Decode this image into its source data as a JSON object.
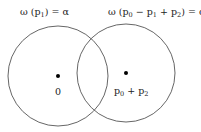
{
  "diagram": {
    "left_circle": {
      "title": {
        "prefix": "ω (p",
        "sub": "1",
        "suffix": ") = α"
      },
      "center_label": "0",
      "stroke": "#555555"
    },
    "right_circle": {
      "title": {
        "parts": [
          {
            "text": "ω (p"
          },
          {
            "sub": "0"
          },
          {
            "text": " − p"
          },
          {
            "sub": "1"
          },
          {
            "text": " + p"
          },
          {
            "sub": "2"
          },
          {
            "text": ") = α"
          }
        ],
        "p0": "0",
        "p1": "1",
        "p2": "2",
        "prefix": "ω (p",
        "mid1": " − p",
        "mid2": " + p",
        "suffix": ") = α"
      },
      "center_label": {
        "a": "p",
        "a_sub": "0",
        "op": " + p",
        "b_sub": "2"
      },
      "stroke": "#555555"
    }
  }
}
